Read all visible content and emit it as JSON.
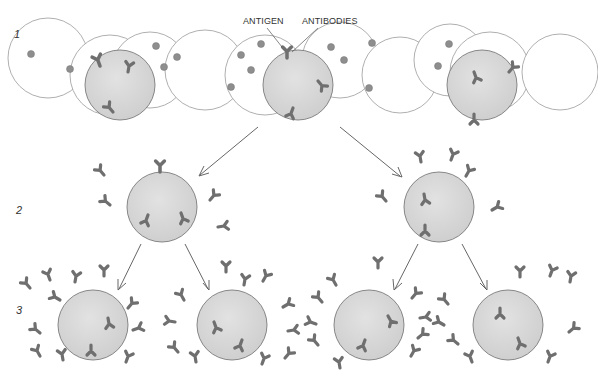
{
  "labels": {
    "antigen": "ANTIGEN",
    "antibodies": "ANTIBODIES"
  },
  "stages": [
    {
      "number": "1",
      "description": "Population of lymphocytes; antigen binds to a cell with a matching antibody receptor"
    },
    {
      "number": "2",
      "description": "Selected cell proliferates and secretes antibodies"
    },
    {
      "number": "3",
      "description": "Clones continue to divide and secrete antibodies"
    }
  ],
  "colors": {
    "cell_fill": "#d8d8d8",
    "cell_stroke": "#7a7a7a",
    "unactivated_cell_fill": "#ffffff",
    "antibody": "#6f6f6f",
    "antigen_dot": "#8e8e8e",
    "arrow": "#555555"
  }
}
